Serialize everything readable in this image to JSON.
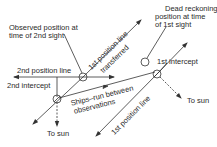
{
  "diagram": {
    "type": "celestial-navigation-running-fix",
    "colors": {
      "line": "#333333",
      "text": "#2a2a2a",
      "background": "#ffffff"
    },
    "labels": {
      "observed_position_line1": "Observed position at",
      "observed_position_line2": "time of 2nd sight",
      "dead_reckoning_line1": "Dead reckoning",
      "dead_reckoning_line2": "position at time",
      "dead_reckoning_line3": "of 1st sight",
      "first_line_transferred_1": "1st position line",
      "first_line_transferred_2": "transferred",
      "second_position_line": "2nd position line",
      "second_intercept": "2nd intercept",
      "first_intercept": "1st intercept",
      "ships_run_1": "Ships–run between",
      "ships_run_2": "observations",
      "first_position_line": "1st position line",
      "to_sun_bottom": "To sun",
      "to_sun_right": "To sun"
    }
  }
}
